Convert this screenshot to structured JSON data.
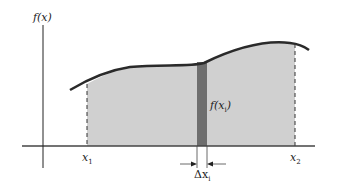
{
  "labels": {
    "y_axis": "f(x)",
    "x1": "x",
    "x1_sub": "1",
    "x2": "x",
    "x2_sub": "2",
    "strip_height": "f(x",
    "strip_height_sub": "i",
    "strip_height_close": ")",
    "strip_width": "Δx",
    "strip_width_sub": "i"
  },
  "colors": {
    "fill": "#d0d0d0",
    "strip": "#6e6e6e",
    "curve": "#2a2a2a",
    "axis": "#333333"
  }
}
